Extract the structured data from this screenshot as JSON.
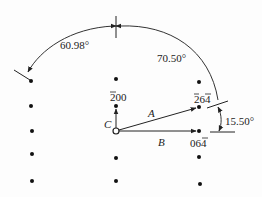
{
  "diagram": {
    "title": "",
    "angles": {
      "a1": "60.98°",
      "a2": "70.50°",
      "a3": "15.50°"
    },
    "vectors": {
      "A": "A",
      "B": "B",
      "C": "C"
    },
    "indices": {
      "i200": "200",
      "i264": "264",
      "i064": "064"
    },
    "colors": {
      "ink": "#222222",
      "background": "#fdfdfd"
    }
  }
}
